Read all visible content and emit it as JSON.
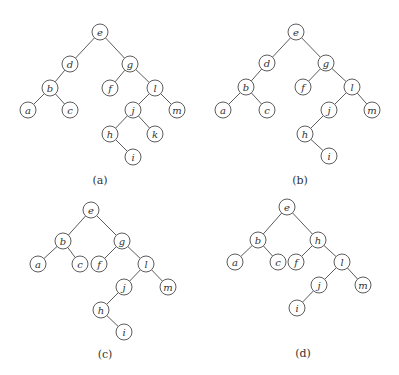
{
  "node_radius": 8,
  "trees": [
    {
      "id": "a",
      "caption": "(a)",
      "caption_pos": [
        100,
        184
      ],
      "nodes": [
        {
          "id": "e",
          "label": "e",
          "x": 100,
          "y": 32
        },
        {
          "id": "d",
          "label": "d",
          "x": 70,
          "y": 64
        },
        {
          "id": "g",
          "label": "g",
          "x": 130,
          "y": 64
        },
        {
          "id": "b",
          "label": "b",
          "x": 50,
          "y": 88
        },
        {
          "id": "f",
          "label": "f",
          "x": 110,
          "y": 88
        },
        {
          "id": "l",
          "label": "l",
          "x": 155,
          "y": 88
        },
        {
          "id": "a",
          "label": "a",
          "x": 28,
          "y": 110
        },
        {
          "id": "c",
          "label": "c",
          "x": 70,
          "y": 110
        },
        {
          "id": "j",
          "label": "j",
          "x": 133,
          "y": 110
        },
        {
          "id": "m",
          "label": "m",
          "x": 177,
          "y": 110
        },
        {
          "id": "h",
          "label": "h",
          "x": 110,
          "y": 134
        },
        {
          "id": "k",
          "label": "k",
          "x": 155,
          "y": 134
        },
        {
          "id": "i",
          "label": "i",
          "x": 133,
          "y": 157
        }
      ],
      "edges": [
        [
          "e",
          "d"
        ],
        [
          "e",
          "g"
        ],
        [
          "d",
          "b"
        ],
        [
          "b",
          "a"
        ],
        [
          "b",
          "c"
        ],
        [
          "g",
          "f"
        ],
        [
          "g",
          "l"
        ],
        [
          "l",
          "j"
        ],
        [
          "l",
          "m"
        ],
        [
          "j",
          "h"
        ],
        [
          "j",
          "k"
        ],
        [
          "h",
          "i"
        ]
      ]
    },
    {
      "id": "b",
      "caption": "(b)",
      "caption_pos": [
        300,
        184
      ],
      "nodes": [
        {
          "id": "e",
          "label": "e",
          "x": 296,
          "y": 32
        },
        {
          "id": "d",
          "label": "d",
          "x": 267,
          "y": 63
        },
        {
          "id": "g",
          "label": "g",
          "x": 326,
          "y": 63
        },
        {
          "id": "b",
          "label": "b",
          "x": 246,
          "y": 87
        },
        {
          "id": "f",
          "label": "f",
          "x": 303,
          "y": 87
        },
        {
          "id": "l",
          "label": "l",
          "x": 352,
          "y": 87
        },
        {
          "id": "a",
          "label": "a",
          "x": 223,
          "y": 110
        },
        {
          "id": "c",
          "label": "c",
          "x": 267,
          "y": 110
        },
        {
          "id": "j",
          "label": "j",
          "x": 329,
          "y": 110
        },
        {
          "id": "m",
          "label": "m",
          "x": 372,
          "y": 110
        },
        {
          "id": "h",
          "label": "h",
          "x": 305,
          "y": 134
        },
        {
          "id": "i",
          "label": "i",
          "x": 329,
          "y": 156
        }
      ],
      "edges": [
        [
          "e",
          "d"
        ],
        [
          "e",
          "g"
        ],
        [
          "d",
          "b"
        ],
        [
          "b",
          "a"
        ],
        [
          "b",
          "c"
        ],
        [
          "g",
          "f"
        ],
        [
          "g",
          "l"
        ],
        [
          "l",
          "j"
        ],
        [
          "l",
          "m"
        ],
        [
          "j",
          "h"
        ],
        [
          "h",
          "i"
        ]
      ]
    },
    {
      "id": "c",
      "caption": "(c)",
      "caption_pos": [
        105,
        358
      ],
      "nodes": [
        {
          "id": "e",
          "label": "e",
          "x": 91,
          "y": 210
        },
        {
          "id": "b",
          "label": "b",
          "x": 63,
          "y": 241
        },
        {
          "id": "g",
          "label": "g",
          "x": 122,
          "y": 241
        },
        {
          "id": "a",
          "label": "a",
          "x": 38,
          "y": 264
        },
        {
          "id": "c",
          "label": "c",
          "x": 80,
          "y": 264
        },
        {
          "id": "f",
          "label": "f",
          "x": 99,
          "y": 264
        },
        {
          "id": "l",
          "label": "l",
          "x": 146,
          "y": 264
        },
        {
          "id": "j",
          "label": "j",
          "x": 124,
          "y": 287
        },
        {
          "id": "m",
          "label": "m",
          "x": 168,
          "y": 287
        },
        {
          "id": "h",
          "label": "h",
          "x": 101,
          "y": 310
        },
        {
          "id": "i",
          "label": "i",
          "x": 124,
          "y": 332
        }
      ],
      "edges": [
        [
          "e",
          "b"
        ],
        [
          "e",
          "g"
        ],
        [
          "b",
          "a"
        ],
        [
          "b",
          "c"
        ],
        [
          "g",
          "f"
        ],
        [
          "g",
          "l"
        ],
        [
          "l",
          "j"
        ],
        [
          "l",
          "m"
        ],
        [
          "j",
          "h"
        ],
        [
          "h",
          "i"
        ]
      ]
    },
    {
      "id": "d",
      "caption": "(d)",
      "caption_pos": [
        303,
        357
      ],
      "nodes": [
        {
          "id": "e",
          "label": "e",
          "x": 287,
          "y": 207
        },
        {
          "id": "b",
          "label": "b",
          "x": 258,
          "y": 240
        },
        {
          "id": "h",
          "label": "h",
          "x": 318,
          "y": 240
        },
        {
          "id": "a",
          "label": "a",
          "x": 235,
          "y": 262
        },
        {
          "id": "c",
          "label": "c",
          "x": 278,
          "y": 262
        },
        {
          "id": "f",
          "label": "f",
          "x": 296,
          "y": 262
        },
        {
          "id": "l",
          "label": "l",
          "x": 342,
          "y": 262
        },
        {
          "id": "j",
          "label": "j",
          "x": 319,
          "y": 285
        },
        {
          "id": "m",
          "label": "m",
          "x": 363,
          "y": 285
        },
        {
          "id": "i",
          "label": "i",
          "x": 297,
          "y": 308
        }
      ],
      "edges": [
        [
          "e",
          "b"
        ],
        [
          "e",
          "h"
        ],
        [
          "b",
          "a"
        ],
        [
          "b",
          "c"
        ],
        [
          "h",
          "f"
        ],
        [
          "h",
          "l"
        ],
        [
          "l",
          "j"
        ],
        [
          "l",
          "m"
        ],
        [
          "j",
          "i"
        ]
      ]
    }
  ]
}
